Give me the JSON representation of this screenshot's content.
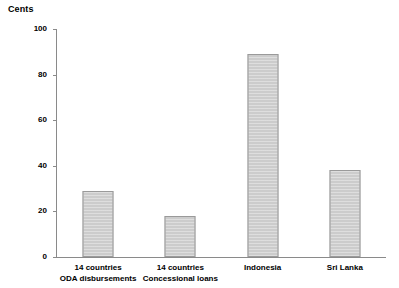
{
  "chart_data": {
    "type": "bar",
    "title": "Cents",
    "xlabel": "",
    "ylabel": "Cents",
    "ylim": [
      0,
      100
    ],
    "yticks": [
      0,
      20,
      40,
      60,
      80,
      100
    ],
    "grid": false,
    "legend": false,
    "categories": [
      "14 countries ODA disbursements",
      "14 countries Concessional loans",
      "Indonesia",
      "Sri Lanka"
    ],
    "category_lines": [
      {
        "line1": "14 countries",
        "line2": "ODA disbursements"
      },
      {
        "line1": "14 countries",
        "line2": "Concessional loans"
      },
      {
        "line1": "Indonesia",
        "line2": ""
      },
      {
        "line1": "Sri Lanka",
        "line2": ""
      }
    ],
    "values": [
      29,
      18,
      89,
      38
    ],
    "bar_color": "#cccccc",
    "bar_border_color": "#9a9a9a",
    "axis_color": "#8a8a8a",
    "background": "#ffffff"
  },
  "axis": {
    "y_tick_labels": [
      "0",
      "20",
      "40",
      "60",
      "80",
      "100"
    ]
  }
}
